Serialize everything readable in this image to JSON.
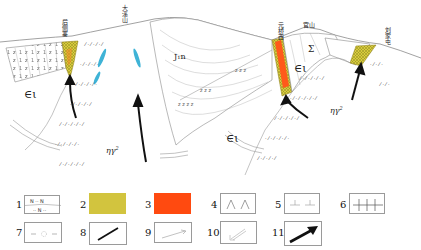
{
  "diagram": {
    "place_names": [
      {
        "id": "houcezhai",
        "label": "后侧寨",
        "x": 64,
        "y": 19
      },
      {
        "id": "dayanshan",
        "label": "大溪山",
        "x": 122,
        "y": 6
      },
      {
        "id": "yuanqiaoxi",
        "label": "元桥西",
        "x": 282,
        "y": 23
      },
      {
        "id": "guanshan",
        "label": "官山",
        "x": 305,
        "y": 22
      },
      {
        "id": "liujiazhai",
        "label": "刘家屯",
        "x": 386,
        "y": 27
      }
    ],
    "unit_labels": [
      {
        "id": "cambrian-left",
        "label": "∈ι",
        "x": 26,
        "y": 93
      },
      {
        "id": "jurassic",
        "label": "J₁n",
        "x": 176,
        "y": 56
      },
      {
        "id": "cambrian-mid",
        "label": "∈ι",
        "x": 228,
        "y": 138
      },
      {
        "id": "cambrian-right",
        "label": "∈ι",
        "x": 297,
        "y": 70
      },
      {
        "id": "sigma",
        "label": "Σ",
        "x": 310,
        "y": 50
      },
      {
        "id": "granite-left",
        "label": "ηγ",
        "sup": "2",
        "sub": "5",
        "x": 108,
        "y": 151
      },
      {
        "id": "granite-right",
        "label": "ηγ",
        "sup": "2",
        "sub": "5",
        "x": 332,
        "y": 110
      }
    ],
    "colors": {
      "yellow_zone": "#d6c63a",
      "orange_zone": "#ff5a1a",
      "cyan_lens": "#3fb3d6",
      "line": "#8a8a8a",
      "arrow": "#111111"
    }
  },
  "legend": {
    "items": [
      {
        "num": "1",
        "symbol": "strata-N-pattern"
      },
      {
        "num": "2",
        "symbol": "yellow-hatched-zone"
      },
      {
        "num": "3",
        "symbol": "orange-zone"
      },
      {
        "num": "4",
        "symbol": "caret-pattern"
      },
      {
        "num": "5",
        "symbol": "inverted-t-pattern"
      },
      {
        "num": "6",
        "symbol": "cross-line-pattern"
      },
      {
        "num": "7",
        "symbol": "circle-dash-pattern"
      },
      {
        "num": "8",
        "symbol": "black-line"
      },
      {
        "num": "9",
        "symbol": "thin-arrow"
      },
      {
        "num": "10",
        "symbol": "double-line-arrow"
      },
      {
        "num": "11",
        "symbol": "thick-black-arrow"
      }
    ],
    "pattern_text": {
      "n1": "N",
      "n2": "N",
      "n3": "N"
    }
  }
}
